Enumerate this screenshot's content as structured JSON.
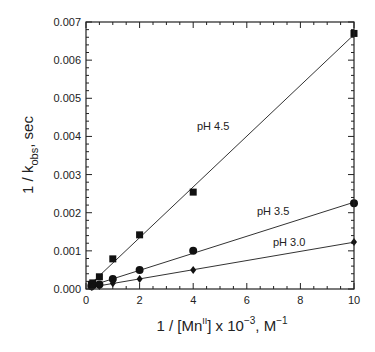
{
  "chart_data": {
    "type": "scatter",
    "title": "",
    "xlabel": "1 / [Mn^II] x 10^-3, M^-1",
    "ylabel": "1 / k_obs, sec",
    "xlim": [
      0,
      10
    ],
    "ylim": [
      0,
      0.007
    ],
    "x_ticks": [
      0,
      2,
      4,
      6,
      8,
      10
    ],
    "y_ticks": [
      "0.000",
      "0.001",
      "0.002",
      "0.003",
      "0.004",
      "0.005",
      "0.006",
      "0.007"
    ],
    "grid": false,
    "legend": "inline labels",
    "series": [
      {
        "name": "pH 4.5",
        "marker": "square",
        "x": [
          0.2,
          0.25,
          0.5,
          1,
          2,
          4,
          10
        ],
        "y": [
          0.00012,
          0.00016,
          0.00032,
          0.00079,
          0.00142,
          0.00254,
          0.0067
        ],
        "fit_line": true
      },
      {
        "name": "pH 3.5",
        "marker": "circle",
        "x": [
          0.2,
          0.25,
          0.5,
          1,
          2,
          4,
          10
        ],
        "y": [
          8e-05,
          0.0001,
          0.00012,
          0.00026,
          0.0005,
          0.001,
          0.00225
        ],
        "fit_line": true
      },
      {
        "name": "pH 3.0",
        "marker": "diamond",
        "x": [
          0.2,
          0.25,
          0.5,
          1,
          2,
          4,
          10
        ],
        "y": [
          5e-05,
          6e-05,
          8e-05,
          0.00015,
          0.00026,
          0.0005,
          0.00123
        ],
        "fit_line": true
      }
    ]
  },
  "labels": {
    "y_axis_title_main": "1 / k",
    "y_axis_title_sub": "obs",
    "y_axis_title_tail": ", sec",
    "x_axis_title_a": "1 / [Mn",
    "x_axis_title_sup": "II",
    "x_axis_title_b": "] x 10",
    "x_axis_title_exp": "−3",
    "x_axis_title_c": ", M",
    "x_axis_title_exp2": "−1",
    "series_label_0": "pH 4.5",
    "series_label_1": "pH 3.5",
    "series_label_2": "pH 3.0"
  }
}
